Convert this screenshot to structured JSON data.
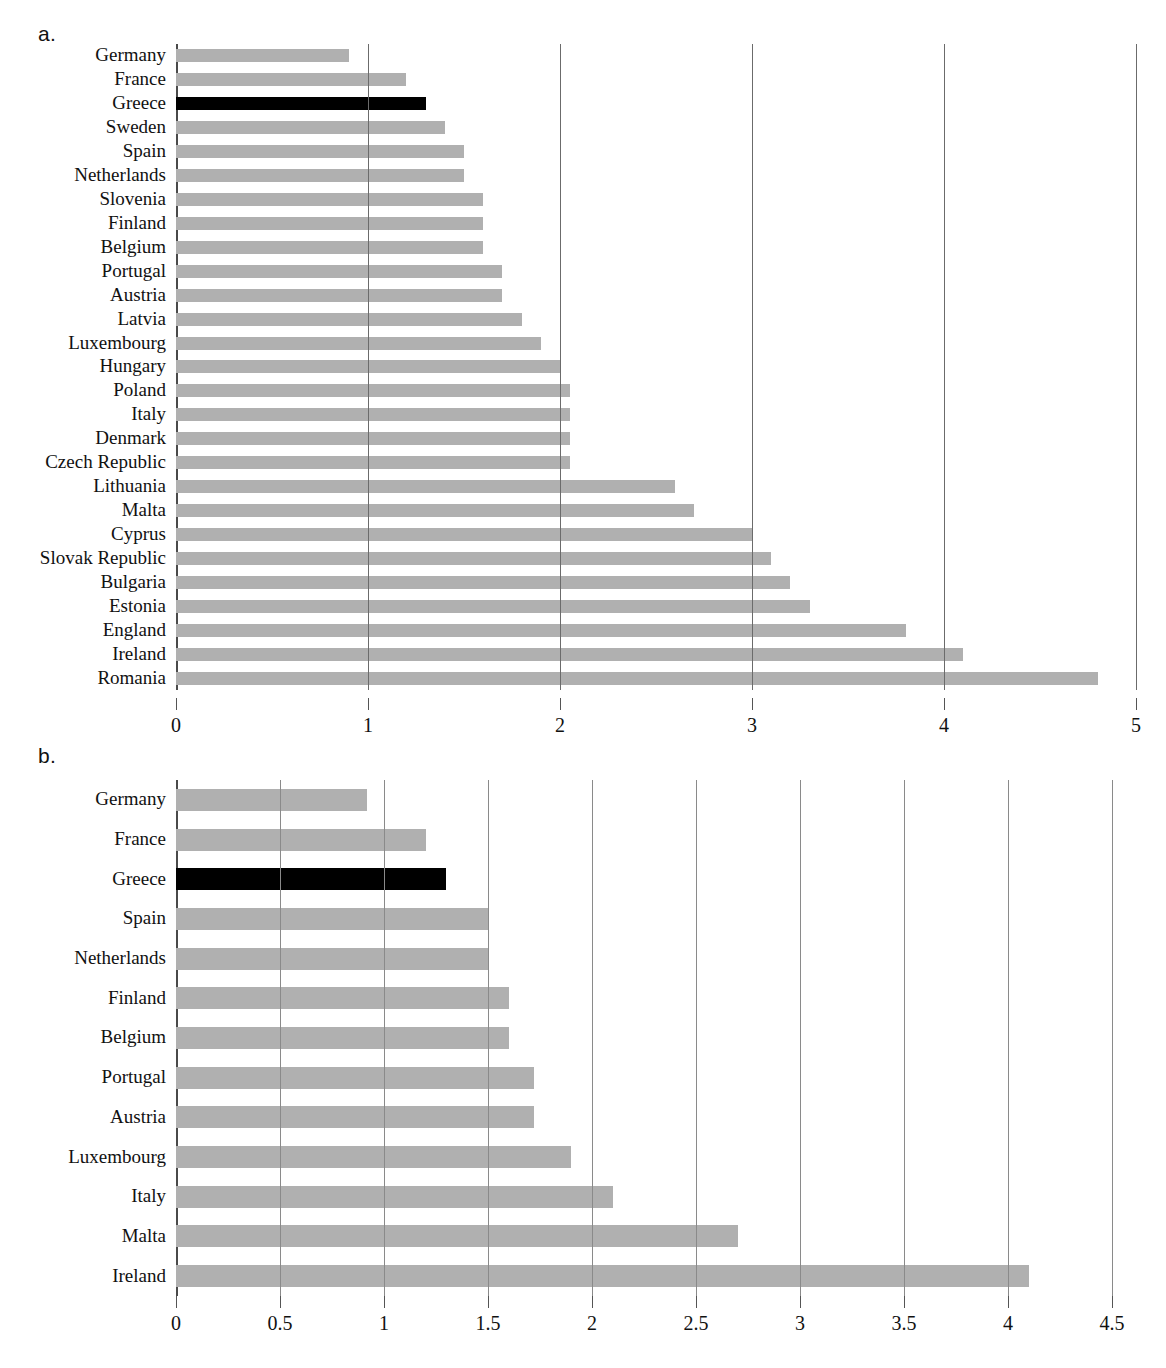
{
  "figure": {
    "panel_a_label": "a.",
    "panel_b_label": "b."
  },
  "chart_data": [
    {
      "id": "a",
      "type": "bar",
      "orientation": "horizontal",
      "title": "",
      "xlabel": "",
      "ylabel": "",
      "xlim": [
        0,
        5
      ],
      "xticks": [
        "0",
        "1",
        "2",
        "3",
        "4",
        "5"
      ],
      "xtick_values": [
        0,
        1,
        2,
        3,
        4,
        5
      ],
      "grid": "vertical",
      "legend": "none",
      "highlight_category": "Greece",
      "bar_color": "#b0b0b0",
      "highlight_color": "#000000",
      "categories": [
        "Germany",
        "France",
        "Greece",
        "Sweden",
        "Spain",
        "Netherlands",
        "Slovenia",
        "Finland",
        "Belgium",
        "Portugal",
        "Austria",
        "Latvia",
        "Luxembourg",
        "Hungary",
        "Poland",
        "Italy",
        "Denmark",
        "Czech Republic",
        "Lithuania",
        "Malta",
        "Cyprus",
        "Slovak Republic",
        "Bulgaria",
        "Estonia",
        "England",
        "Ireland",
        "Romania"
      ],
      "values": [
        0.9,
        1.2,
        1.3,
        1.4,
        1.5,
        1.5,
        1.6,
        1.6,
        1.6,
        1.7,
        1.7,
        1.8,
        1.9,
        2.0,
        2.05,
        2.05,
        2.05,
        2.05,
        2.6,
        2.7,
        3.0,
        3.1,
        3.2,
        3.3,
        3.8,
        4.1,
        4.8
      ]
    },
    {
      "id": "b",
      "type": "bar",
      "orientation": "horizontal",
      "title": "",
      "xlabel": "",
      "ylabel": "",
      "xlim": [
        0,
        4.5
      ],
      "xticks": [
        "0",
        "0.5",
        "1",
        "1.5",
        "2",
        "2.5",
        "3",
        "3.5",
        "4",
        "4.5"
      ],
      "xtick_values": [
        0,
        0.5,
        1,
        1.5,
        2,
        2.5,
        3,
        3.5,
        4,
        4.5
      ],
      "grid": "vertical",
      "legend": "none",
      "highlight_category": "Greece",
      "bar_color": "#b0b0b0",
      "highlight_color": "#000000",
      "categories": [
        "Germany",
        "France",
        "Greece",
        "Spain",
        "Netherlands",
        "Finland",
        "Belgium",
        "Portugal",
        "Austria",
        "Luxembourg",
        "Italy",
        "Malta",
        "Ireland"
      ],
      "values": [
        0.92,
        1.2,
        1.3,
        1.5,
        1.5,
        1.6,
        1.6,
        1.72,
        1.72,
        1.9,
        2.1,
        2.7,
        4.1
      ]
    }
  ]
}
